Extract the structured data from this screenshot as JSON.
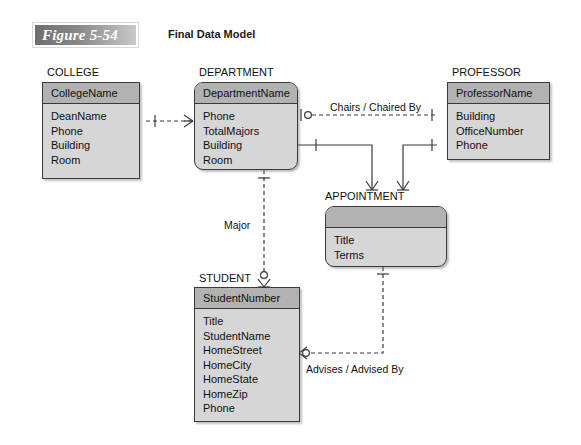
{
  "caption": {
    "figure_label": "Figure 5-54",
    "title": "Final Data Model"
  },
  "colors": {
    "header_fill": "#b2b2b2",
    "body_fill": "#d6d6d6",
    "line": "#3a3a3a",
    "background": "#ffffff"
  },
  "diagram": {
    "type": "entity-relationship-diagram",
    "notation": "crows-foot",
    "entities": [
      {
        "id": "college",
        "name": "COLLEGE",
        "identifier": "CollegeName",
        "attributes": [
          "DeanName",
          "Phone",
          "Building",
          "Room"
        ],
        "corners": "square"
      },
      {
        "id": "department",
        "name": "DEPARTMENT",
        "identifier": "DepartmentName",
        "attributes": [
          "Phone",
          "TotalMajors",
          "Building",
          "Room"
        ],
        "corners": "rounded"
      },
      {
        "id": "professor",
        "name": "PROFESSOR",
        "identifier": "ProfessorName",
        "attributes": [
          "Building",
          "OfficeNumber",
          "Phone"
        ],
        "corners": "square"
      },
      {
        "id": "appointment",
        "name": "APPOINTMENT",
        "identifier": "",
        "attributes": [
          "Title",
          "Terms"
        ],
        "corners": "rounded"
      },
      {
        "id": "student",
        "name": "STUDENT",
        "identifier": "StudentNumber",
        "attributes": [
          "Title",
          "StudentName",
          "HomeStreet",
          "HomeCity",
          "HomeState",
          "HomeZip",
          "Phone"
        ],
        "corners": "square"
      }
    ],
    "relationships": [
      {
        "id": "college-department",
        "label": "",
        "from": "COLLEGE",
        "to": "DEPARTMENT",
        "line": "dashed",
        "from_cardinality": "mandatory-one",
        "to_cardinality": "mandatory-many"
      },
      {
        "id": "chairs",
        "label": "Chairs / Chaired By",
        "from": "DEPARTMENT",
        "to": "PROFESSOR",
        "line": "dashed",
        "from_cardinality": "optional-one",
        "to_cardinality": "mandatory-one"
      },
      {
        "id": "department-appointment",
        "label": "",
        "from": "DEPARTMENT",
        "to": "APPOINTMENT",
        "line": "solid",
        "from_cardinality": "mandatory-one",
        "to_cardinality": "mandatory-many"
      },
      {
        "id": "professor-appointment",
        "label": "",
        "from": "PROFESSOR",
        "to": "APPOINTMENT",
        "line": "solid",
        "from_cardinality": "mandatory-one",
        "to_cardinality": "mandatory-many"
      },
      {
        "id": "major",
        "label": "Major",
        "from": "DEPARTMENT",
        "to": "STUDENT",
        "line": "dashed",
        "from_cardinality": "mandatory-one",
        "to_cardinality": "optional-many"
      },
      {
        "id": "advises",
        "label": "Advises / Advised By",
        "from": "APPOINTMENT",
        "to": "STUDENT",
        "line": "dashed",
        "from_cardinality": "mandatory-one",
        "to_cardinality": "optional-many"
      }
    ]
  }
}
